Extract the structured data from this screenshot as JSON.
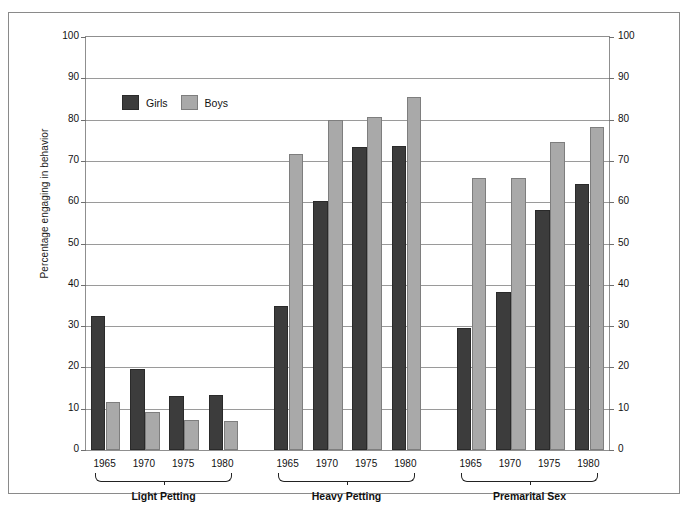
{
  "chart_data": {
    "type": "bar",
    "title": "",
    "xlabel": "",
    "ylabel": "Percentage engaging in behavior",
    "ylim": [
      0,
      100
    ],
    "yticks": [
      0,
      10,
      20,
      30,
      40,
      50,
      60,
      70,
      80,
      90,
      100
    ],
    "ytick_labels": [
      "0",
      "10",
      "20",
      "30",
      "40",
      "50",
      "60",
      "70",
      "80",
      "90",
      "100"
    ],
    "right_axis": {
      "ylim": [
        0,
        100
      ],
      "yticks": [
        0,
        10,
        20,
        30,
        40,
        50,
        60,
        70,
        80,
        90,
        100
      ],
      "ytick_labels": [
        "0",
        "10",
        "20",
        "30",
        "40",
        "50",
        "60",
        "70",
        "80",
        "90",
        "100"
      ]
    },
    "grid": true,
    "legend": {
      "position": "upper-left-inside",
      "entries": [
        {
          "name": "Girls",
          "color": "#3c3c3c"
        },
        {
          "name": "Boys",
          "color": "#a9a9a9"
        }
      ]
    },
    "categories": [
      "1965",
      "1970",
      "1975",
      "1980"
    ],
    "groups": [
      {
        "label": "Light Petting",
        "categories": [
          "1965",
          "1970",
          "1975",
          "1980"
        ],
        "series": [
          {
            "name": "Girls",
            "values": [
              32.5,
              19.7,
              13.0,
              13.3
            ]
          },
          {
            "name": "Boys",
            "values": [
              11.6,
              9.1,
              7.2,
              7.0
            ]
          }
        ]
      },
      {
        "label": "Heavy Petting",
        "categories": [
          "1965",
          "1970",
          "1975",
          "1980"
        ],
        "series": [
          {
            "name": "Girls",
            "values": [
              34.8,
              60.3,
              73.3,
              73.6
            ]
          },
          {
            "name": "Boys",
            "values": [
              71.6,
              79.8,
              80.7,
              85.4
            ]
          }
        ]
      },
      {
        "label": "Premarital Sex",
        "categories": [
          "1965",
          "1970",
          "1975",
          "1980"
        ],
        "series": [
          {
            "name": "Girls",
            "values": [
              29.6,
              38.3,
              58.1,
              64.4
            ]
          },
          {
            "name": "Boys",
            "values": [
              65.8,
              65.8,
              74.7,
              78.3
            ]
          }
        ]
      }
    ]
  },
  "colors": {
    "girls": "#3c3c3c",
    "boys": "#a9a9a9",
    "grid": "#9a9a9a",
    "axis": "#8f8f8f",
    "frame": "#8a8a8a",
    "text": "#111111"
  }
}
